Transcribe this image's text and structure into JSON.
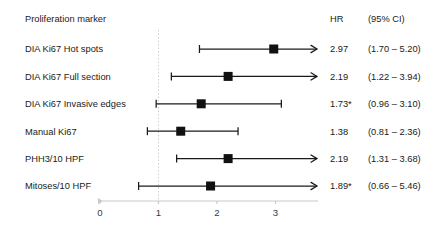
{
  "chart_data": {
    "type": "forest",
    "title": "",
    "xlabel": "",
    "ylabel": "",
    "xlim": [
      0,
      3.72
    ],
    "grid": false,
    "reference_line": 1,
    "axis_ticks": [
      {
        "value": 0,
        "label": "0"
      },
      {
        "value": 1,
        "label": "1"
      },
      {
        "value": 2,
        "label": "2"
      },
      {
        "value": 3,
        "label": "3"
      }
    ],
    "columns": {
      "marker": "Proliferation marker",
      "hr": "HR",
      "ci": "(95% CI)"
    },
    "rows": [
      {
        "label": "DIA Ki67 Hot spots",
        "hr_text": "2.97",
        "ci_text": "(1.70 – 5.20)",
        "hr": 2.97,
        "ci_low": 1.7,
        "ci_high": 5.2,
        "truncated_right": true,
        "significant": true
      },
      {
        "label": "DIA Ki67 Full section",
        "hr_text": "2.19",
        "ci_text": "(1.22 – 3.94)",
        "hr": 2.19,
        "ci_low": 1.22,
        "ci_high": 3.94,
        "truncated_right": true,
        "significant": true
      },
      {
        "label": "DIA Ki67 Invasive edges",
        "hr_text": "1.73*",
        "ci_text": "(0.96 – 3.10)",
        "hr": 1.73,
        "ci_low": 0.96,
        "ci_high": 3.1,
        "truncated_right": false,
        "significant": false
      },
      {
        "label": "Manual Ki67",
        "hr_text": "1.38",
        "ci_text": "(0.81 – 2.36)",
        "hr": 1.38,
        "ci_low": 0.81,
        "ci_high": 2.36,
        "truncated_right": false,
        "significant": false
      },
      {
        "label": "PHH3/10 HPF",
        "hr_text": "2.19",
        "ci_text": "(1.31 – 3.68)",
        "hr": 2.19,
        "ci_low": 1.31,
        "ci_high": 3.68,
        "truncated_right": true,
        "significant": true
      },
      {
        "label": "Mitoses/10 HPF",
        "hr_text": "1.89*",
        "ci_text": "(0.66 – 5.46)",
        "hr": 1.89,
        "ci_low": 0.66,
        "ci_high": 5.46,
        "truncated_right": true,
        "significant": false
      }
    ]
  },
  "colors": {
    "marker": "#111111",
    "line": "#1a1a1a",
    "axis": "#c9c9c9",
    "reference": "#cfcfcf",
    "text": "#1a1a1a"
  }
}
